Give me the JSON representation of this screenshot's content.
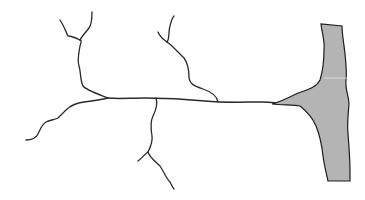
{
  "diagram": {
    "type": "neuron-line-drawing",
    "colors": {
      "background": "#ffffff",
      "line": "#2a2a2a",
      "terminal_fill": "#b4b4b4"
    },
    "elements": [
      {
        "id": "upper-left-dendrite",
        "kind": "branch"
      },
      {
        "id": "upper-middle-dendrite",
        "kind": "branch"
      },
      {
        "id": "lower-left-dendrite",
        "kind": "branch"
      },
      {
        "id": "lower-middle-dendrite",
        "kind": "branch"
      },
      {
        "id": "main-axon",
        "kind": "horizontal process"
      },
      {
        "id": "gray-terminal",
        "kind": "filled shape"
      }
    ]
  }
}
